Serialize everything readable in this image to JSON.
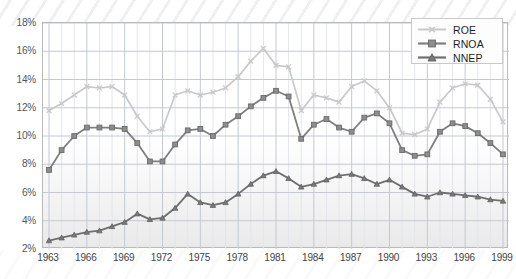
{
  "chart_data": {
    "type": "line",
    "title": "",
    "xlabel": "",
    "ylabel": "",
    "xlim": [
      1963,
      1999
    ],
    "ylim": [
      2,
      18
    ],
    "ytick_labels": [
      "2%",
      "4%",
      "6%",
      "8%",
      "10%",
      "12%",
      "14%",
      "16%",
      "18%"
    ],
    "ytick_values": [
      2,
      4,
      6,
      8,
      10,
      12,
      14,
      16,
      18
    ],
    "xtick_labels": [
      "1963",
      "1966",
      "1969",
      "1972",
      "1975",
      "1978",
      "1981",
      "1984",
      "1987",
      "1990",
      "1993",
      "1996",
      "1999"
    ],
    "xtick_values": [
      1963,
      1966,
      1969,
      1972,
      1975,
      1978,
      1981,
      1984,
      1987,
      1990,
      1993,
      1996,
      1999
    ],
    "grid": true,
    "grid_minor_x": true,
    "legend_position": "top-right",
    "x": [
      1963,
      1964,
      1965,
      1966,
      1967,
      1968,
      1969,
      1970,
      1971,
      1972,
      1973,
      1974,
      1975,
      1976,
      1977,
      1978,
      1979,
      1980,
      1981,
      1982,
      1983,
      1984,
      1985,
      1986,
      1987,
      1988,
      1989,
      1990,
      1991,
      1992,
      1993,
      1994,
      1995,
      1996,
      1997,
      1998,
      1999
    ],
    "series": [
      {
        "name": "ROE",
        "color": "#c9c9c9",
        "marker": "x",
        "values": [
          11.8,
          12.3,
          12.9,
          13.5,
          13.4,
          13.5,
          12.9,
          11.4,
          10.3,
          10.5,
          12.9,
          13.2,
          12.9,
          13.1,
          13.4,
          14.2,
          15.3,
          16.2,
          15.0,
          14.9,
          11.8,
          12.9,
          12.7,
          12.4,
          13.5,
          13.9,
          13.2,
          12.0,
          10.2,
          10.1,
          10.5,
          12.4,
          13.4,
          13.7,
          13.6,
          12.6,
          11.0
        ]
      },
      {
        "name": "RNOA",
        "color": "#7e7e7e",
        "marker": "square",
        "values": [
          7.6,
          9.0,
          10.0,
          10.6,
          10.6,
          10.6,
          10.5,
          9.5,
          8.2,
          8.2,
          9.4,
          10.4,
          10.5,
          10.0,
          10.8,
          11.4,
          12.1,
          12.7,
          13.2,
          12.8,
          9.8,
          10.8,
          11.2,
          10.6,
          10.3,
          11.3,
          11.6,
          10.9,
          9.0,
          8.6,
          8.7,
          10.3,
          10.9,
          10.7,
          10.2,
          9.5,
          8.7
        ]
      },
      {
        "name": "NNEP",
        "color": "#6e6e6e",
        "marker": "triangle",
        "values": [
          2.6,
          2.8,
          3.0,
          3.2,
          3.3,
          3.6,
          3.9,
          4.5,
          4.1,
          4.2,
          4.9,
          5.9,
          5.3,
          5.1,
          5.3,
          5.9,
          6.6,
          7.2,
          7.5,
          7.0,
          6.4,
          6.6,
          6.9,
          7.2,
          7.3,
          7.0,
          6.6,
          6.9,
          6.4,
          5.9,
          5.7,
          6.0,
          5.9,
          5.8,
          5.7,
          5.5,
          5.4
        ]
      }
    ]
  },
  "legend": {
    "items": [
      {
        "label": "ROE"
      },
      {
        "label": "RNOA"
      },
      {
        "label": "NNEP"
      }
    ]
  }
}
